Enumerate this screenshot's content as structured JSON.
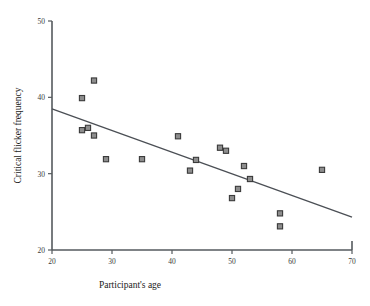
{
  "chart_data": {
    "type": "scatter",
    "title": "",
    "xlabel": "Participant's age",
    "ylabel": "Critical flicker frequency",
    "xlim": [
      20,
      70
    ],
    "ylim": [
      20,
      50
    ],
    "xticks": [
      20,
      30,
      40,
      50,
      60,
      70
    ],
    "yticks": [
      20,
      30,
      40,
      50
    ],
    "grid": false,
    "legend": null,
    "marker": "square",
    "marker_fill": "#8d8d8d",
    "marker_edge": "#3a3a3a",
    "line_color": "#4b4f55",
    "axis_color": "#555a5e",
    "points": [
      {
        "x": 25.0,
        "y": 39.9
      },
      {
        "x": 27.0,
        "y": 42.2
      },
      {
        "x": 25.0,
        "y": 35.7
      },
      {
        "x": 26.0,
        "y": 36.0
      },
      {
        "x": 27.0,
        "y": 35.0
      },
      {
        "x": 29.0,
        "y": 31.9
      },
      {
        "x": 35.0,
        "y": 31.9
      },
      {
        "x": 41.0,
        "y": 34.9
      },
      {
        "x": 43.0,
        "y": 30.4
      },
      {
        "x": 44.0,
        "y": 31.8
      },
      {
        "x": 48.0,
        "y": 33.4
      },
      {
        "x": 49.0,
        "y": 33.0
      },
      {
        "x": 50.0,
        "y": 26.8
      },
      {
        "x": 51.0,
        "y": 28.0
      },
      {
        "x": 52.0,
        "y": 31.0
      },
      {
        "x": 53.0,
        "y": 29.3
      },
      {
        "x": 58.0,
        "y": 24.8
      },
      {
        "x": 58.0,
        "y": 23.1
      },
      {
        "x": 65.0,
        "y": 30.5
      }
    ],
    "trendline": {
      "x": [
        20,
        70
      ],
      "y": [
        38.5,
        24.3
      ],
      "description": "linear regression line"
    }
  }
}
